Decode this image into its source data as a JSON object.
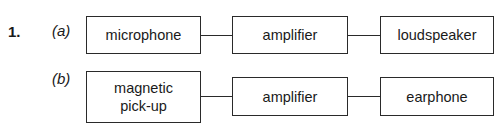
{
  "question": {
    "number": "1.",
    "parts": [
      {
        "label": "(a)",
        "blocks": [
          "microphone",
          "amplifier",
          "loudspeaker"
        ]
      },
      {
        "label": "(b)",
        "blocks": [
          "magnetic pick-up",
          "amplifier",
          "earphone"
        ]
      }
    ]
  }
}
